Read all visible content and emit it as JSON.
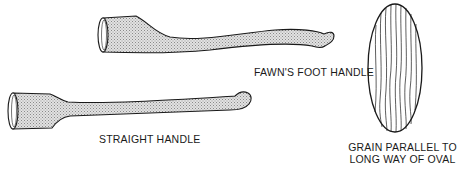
{
  "figure": {
    "labels": {
      "fawns_foot": "FAWN'S FOOT HANDLE",
      "straight": "STRAIGHT HANDLE",
      "grain_line1": "GRAIN PARALLEL TO",
      "grain_line2": "LONG WAY OF OVAL"
    },
    "colors": {
      "outline": "#1a1a1a",
      "shading": "#c8c8c8",
      "background": "#ffffff"
    }
  }
}
